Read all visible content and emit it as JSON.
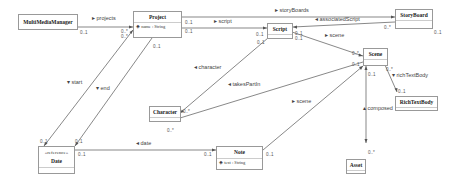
{
  "classes": {
    "multimedia_manager": {
      "name": "MultiMediaManager"
    },
    "project": {
      "name": "Project",
      "attr": "name : String"
    },
    "script": {
      "name": "Script"
    },
    "storyboard": {
      "name": "StoryBoard"
    },
    "scene": {
      "name": "Scene"
    },
    "rich_text_body": {
      "name": "RichTextBody"
    },
    "character": {
      "name": "Character"
    },
    "date": {
      "stereotype": "«reference»",
      "name": "Date"
    },
    "note": {
      "name": "Note",
      "attr": "text : String"
    },
    "asset": {
      "name": "Asset"
    }
  },
  "associations": {
    "projects": "▸ projects",
    "script": "▸ script",
    "storyboards": "▸ storyBoards",
    "associated_script": "◂ associatedScript",
    "scene_script": "▸ scene",
    "rich_text_body": "▾ richTextBody",
    "character": "◂ character",
    "takes_part_in": "◂ takesPartIn",
    "scene_note": "▸ scene",
    "composed": "▴ composed",
    "start": "▾ start",
    "end": "▾ end",
    "date": "◂ date"
  },
  "multiplicities": {
    "mm_projects": "0..1",
    "proj_mm": "0..*",
    "proj_a": "0..*",
    "proj_script": "0..1",
    "proj_script2": "0..1",
    "proj_bottom": "0..1",
    "script_left": "0..1",
    "script_bottom": "0..1",
    "script_right1": "0..1",
    "script_right2": "0..1",
    "storyboard_left": "0..*",
    "storyboard_bottom": "0..1",
    "scene_left": "0..*",
    "scene_left2": "0..1",
    "scene_bottom": "0..1",
    "scene_right": "0..*",
    "rtb_top": "0..1",
    "character_right": "0..*",
    "character_bottom": "0..*",
    "date_top1": "0..1",
    "date_top2": "0..1",
    "date_right": "0..1",
    "note_left": "0..1",
    "note_right": "0..1",
    "asset_top": "0..*"
  }
}
